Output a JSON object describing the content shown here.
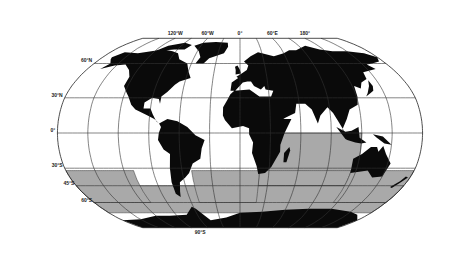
{
  "map": {
    "projection": "robinson",
    "colors": {
      "land": "#0a0a0a",
      "shaded_ocean": "#a9a9a9",
      "ocean": "#ffffff",
      "grid": "#333333"
    },
    "graticule_step_deg": 30,
    "longitude_labels": [
      {
        "lon": -120,
        "text": "120°W"
      },
      {
        "lon": -60,
        "text": "60°W"
      },
      {
        "lon": 0,
        "text": "0°"
      },
      {
        "lon": 60,
        "text": "60°E"
      },
      {
        "lon": 120,
        "text": "180°"
      }
    ],
    "latitude_labels": [
      {
        "lat": 60,
        "text": "60°N"
      },
      {
        "lat": 30,
        "text": "30°N"
      },
      {
        "lat": 0,
        "text": "0°"
      },
      {
        "lat": -30,
        "text": "30°S"
      },
      {
        "lat": -45,
        "text": "45°S"
      },
      {
        "lat": -60,
        "text": "60°S"
      },
      {
        "lat": -90,
        "text": "90°S"
      }
    ],
    "shaded_regions": [
      {
        "name": "indian-ocean-region",
        "lon": [
          20,
          120
        ],
        "lat": [
          -45,
          0
        ]
      },
      {
        "name": "indian-ocean-south",
        "lon": [
          20,
          115
        ],
        "lat": [
          -45,
          -32
        ]
      },
      {
        "name": "southern-ocean-band",
        "lon": [
          -180,
          180
        ],
        "lat": [
          -70,
          -45
        ]
      },
      {
        "name": "south-atlantic-region",
        "lon": [
          -50,
          20
        ],
        "lat": [
          -60,
          -32
        ]
      },
      {
        "name": "south-pacific-west",
        "lon": [
          -180,
          -110
        ],
        "lat": [
          -60,
          -32
        ]
      },
      {
        "name": "tasman-region",
        "lon": [
          115,
          180
        ],
        "lat": [
          -60,
          -32
        ]
      }
    ]
  }
}
